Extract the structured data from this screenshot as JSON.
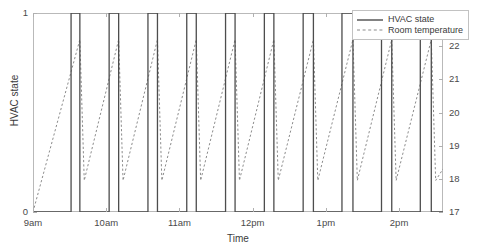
{
  "chart_data": {
    "type": "line",
    "title": "",
    "xlabel": "Time",
    "ylabel": "HVAC state",
    "y2label": "Room temperature (°C)",
    "grid": false,
    "legend_position": "top-right",
    "xlim": [
      9,
      14.6
    ],
    "xticks": [
      9,
      10,
      11,
      12,
      13,
      14
    ],
    "xticklabels": [
      "9am",
      "10am",
      "11am",
      "12pm",
      "1pm",
      "2pm"
    ],
    "ylim": [
      0,
      1
    ],
    "yticks": [
      0,
      1
    ],
    "yticklabels": [
      "0",
      "1"
    ],
    "y2lim": [
      17,
      23
    ],
    "y2ticks": [
      17,
      18,
      19,
      20,
      21,
      22,
      23
    ],
    "y2ticklabels": [
      "17",
      "18",
      "19",
      "20",
      "21",
      "22",
      "23"
    ],
    "series": [
      {
        "name": "HVAC state",
        "style": "solid",
        "color": "#4d4d4d",
        "axis": "left",
        "description": "Square-wave on/off cycling, 10 on-pulses",
        "points": [
          [
            9.0,
            0
          ],
          [
            9.52,
            0
          ],
          [
            9.52,
            1
          ],
          [
            9.64,
            1
          ],
          [
            9.64,
            0
          ],
          [
            10.04,
            0
          ],
          [
            10.04,
            1
          ],
          [
            10.17,
            1
          ],
          [
            10.17,
            0
          ],
          [
            10.57,
            0
          ],
          [
            10.57,
            1
          ],
          [
            10.7,
            1
          ],
          [
            10.7,
            0
          ],
          [
            11.1,
            0
          ],
          [
            11.1,
            1
          ],
          [
            11.23,
            1
          ],
          [
            11.23,
            0
          ],
          [
            11.63,
            0
          ],
          [
            11.63,
            1
          ],
          [
            11.76,
            1
          ],
          [
            11.76,
            0
          ],
          [
            12.16,
            0
          ],
          [
            12.16,
            1
          ],
          [
            12.29,
            1
          ],
          [
            12.29,
            0
          ],
          [
            12.69,
            0
          ],
          [
            12.69,
            1
          ],
          [
            12.83,
            1
          ],
          [
            12.83,
            0
          ],
          [
            13.22,
            0
          ],
          [
            13.22,
            1
          ],
          [
            13.37,
            1
          ],
          [
            13.37,
            0
          ],
          [
            13.76,
            0
          ],
          [
            13.76,
            1
          ],
          [
            13.9,
            1
          ],
          [
            13.9,
            0
          ],
          [
            14.29,
            0
          ],
          [
            14.29,
            1
          ],
          [
            14.44,
            1
          ],
          [
            14.44,
            0
          ],
          [
            14.6,
            0
          ]
        ]
      },
      {
        "name": "Room temperature",
        "style": "dashed",
        "color": "#8c8c8c",
        "axis": "right",
        "description": "Sawtooth: slow rise while HVAC off, sharp fall while HVAC on",
        "points": [
          [
            9.0,
            17.0
          ],
          [
            9.64,
            22.2
          ],
          [
            9.7,
            17.95
          ],
          [
            10.17,
            22.2
          ],
          [
            10.23,
            17.95
          ],
          [
            10.7,
            22.2
          ],
          [
            10.76,
            17.95
          ],
          [
            11.23,
            22.2
          ],
          [
            11.29,
            17.95
          ],
          [
            11.76,
            22.2
          ],
          [
            11.82,
            17.95
          ],
          [
            12.29,
            22.2
          ],
          [
            12.35,
            17.95
          ],
          [
            12.83,
            22.2
          ],
          [
            12.89,
            17.95
          ],
          [
            13.37,
            22.2
          ],
          [
            13.43,
            17.95
          ],
          [
            13.9,
            22.2
          ],
          [
            13.96,
            17.95
          ],
          [
            14.44,
            22.2
          ],
          [
            14.5,
            17.95
          ],
          [
            14.6,
            18.3
          ]
        ]
      }
    ]
  },
  "legend": {
    "items": [
      {
        "label": "HVAC state",
        "style": "solid"
      },
      {
        "label": "Room temperature",
        "style": "dashed"
      }
    ]
  },
  "axes": {
    "x_title": "Time",
    "y_left_title": "HVAC state",
    "y_right_title": "Room temperature (°C)"
  },
  "colors": {
    "hvac_line": "#4d4d4d",
    "temp_line": "#8c8c8c",
    "axis": "#b9b9b9",
    "text": "#3a3a3a",
    "background": "#ffffff"
  }
}
